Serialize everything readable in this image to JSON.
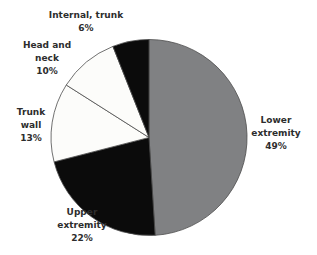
{
  "chart_data": {
    "type": "pie",
    "title": "",
    "unit": "%",
    "direction": "clockwise",
    "start_angle_deg": 0,
    "legend": "none",
    "labels_position": "outside",
    "background": "#ffffff",
    "outline_color": "#4d4d4d",
    "label_color": "#2d2d2d",
    "categories": [
      "Lower extremity",
      "Upper extremity",
      "Trunk wall",
      "Head and neck",
      "Internal, trunk"
    ],
    "values": [
      49,
      22,
      13,
      10,
      6
    ],
    "slices": [
      {
        "name": "Lower extremity",
        "value": 49,
        "color": "#808183",
        "label_lines": [
          "Lower",
          "extremity",
          "49%"
        ]
      },
      {
        "name": "Upper extremity",
        "value": 22,
        "color": "#0b0b0b",
        "label_lines": [
          "Upper",
          "extremity",
          "22%"
        ]
      },
      {
        "name": "Trunk wall",
        "value": 13,
        "color": "#fcfcfa",
        "label_lines": [
          "Trunk",
          "wall",
          "13%"
        ]
      },
      {
        "name": "Head and neck",
        "value": 10,
        "color": "#fcfcfa",
        "label_lines": [
          "Head and",
          "neck",
          "10%"
        ]
      },
      {
        "name": "Internal, trunk",
        "value": 6,
        "color": "#0b0b0b",
        "label_lines": [
          "Internal, trunk",
          "6%"
        ]
      }
    ]
  }
}
